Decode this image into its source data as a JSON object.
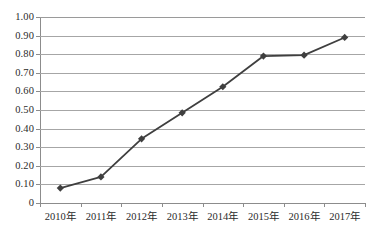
{
  "chart_data": {
    "type": "line",
    "title": "",
    "subtitle": "",
    "xlabel": "",
    "ylabel": "",
    "categories": [
      "2010年",
      "2011年",
      "2012年",
      "2013年",
      "2014年",
      "2015年",
      "2016年",
      "2017年"
    ],
    "series": [
      {
        "name": "",
        "values": [
          0.08,
          0.14,
          0.345,
          0.485,
          0.625,
          0.79,
          0.795,
          0.89
        ]
      }
    ],
    "ylim": [
      0,
      1.0
    ],
    "ytick_values": [
      0,
      0.1,
      0.2,
      0.3,
      0.4,
      0.5,
      0.6,
      0.7,
      0.8,
      0.9,
      1.0
    ],
    "ytick_labels": [
      "0",
      "0.10",
      "0.20",
      "0.30",
      "0.40",
      "0.50",
      "0.60",
      "0.70",
      "0.80",
      "0.90",
      "1.00"
    ],
    "grid": true,
    "legend": "none",
    "marker": "diamond",
    "colors": {
      "line": "#3f3f3f",
      "marker": "#3f3f3f",
      "gridline": "#a6a6a6",
      "axis": "#8c8c8c",
      "text": "#2b2b2b",
      "background": "#ffffff"
    }
  }
}
